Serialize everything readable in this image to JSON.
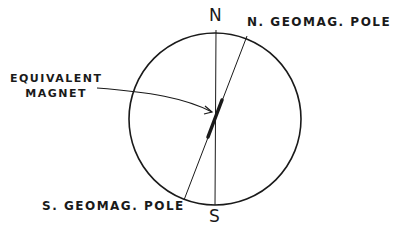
{
  "diagram": {
    "cardinal": {
      "north": "N",
      "south": "S"
    },
    "labels": {
      "n_geomag_pole": "N. GEOMAG. POLE",
      "s_geomag_pole": "S. GEOMAG. POLE",
      "equivalent_magnet_line1": "EQUIVALENT",
      "equivalent_magnet_line2": "MAGNET"
    },
    "colors": {
      "ink": "#1a1a1a",
      "background": "#ffffff"
    }
  }
}
